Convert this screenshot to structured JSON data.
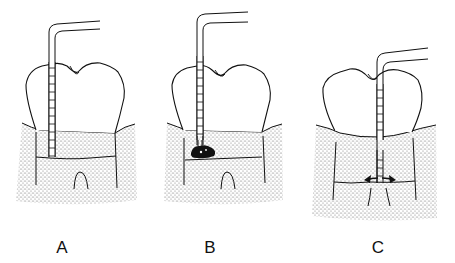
{
  "figure": {
    "panels": [
      {
        "id": "A",
        "label": "A",
        "description": "Probe tip at base of sulcus (healthy attachment)"
      },
      {
        "id": "B",
        "label": "B",
        "description": "Probe tip stopped by subgingival calculus deposit"
      },
      {
        "id": "C",
        "label": "C",
        "description": "Probe penetrating to base of pocket with lateral arrows"
      }
    ]
  },
  "colors": {
    "line": "#111111",
    "background": "#ffffff",
    "gingiva_dots": "#555555"
  }
}
